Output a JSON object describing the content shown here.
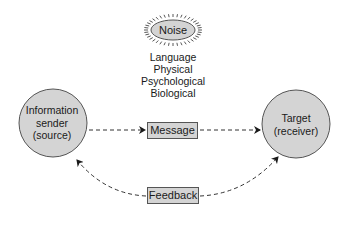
{
  "diagram": {
    "noise": {
      "label": "Noise"
    },
    "noise_factors": [
      "Language",
      "Physical",
      "Psychological",
      "Biological"
    ],
    "sender": {
      "lines": [
        "Information",
        "sender",
        "(source)"
      ]
    },
    "target": {
      "lines": [
        "Target",
        "(receiver)"
      ]
    },
    "message": {
      "label": "Message"
    },
    "feedback": {
      "label": "Feedback"
    },
    "colors": {
      "node_fill": "#d4d4d4",
      "stroke": "#555555",
      "text": "#1a1a1a"
    },
    "edges": [
      {
        "from": "sender",
        "to": "message",
        "style": "dashed-arrow"
      },
      {
        "from": "message",
        "to": "target",
        "style": "dashed-arrow"
      },
      {
        "from": "target",
        "to": "feedback",
        "style": "dashed-curve"
      },
      {
        "from": "feedback",
        "to": "sender",
        "style": "dashed-curve-arrow"
      },
      {
        "from": "feedback",
        "to": "target",
        "style": "dashed-curve-arrow"
      }
    ]
  }
}
